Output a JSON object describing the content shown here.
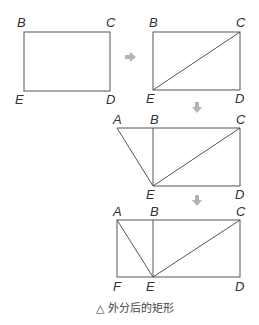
{
  "diagram": {
    "title": "外分后的矩形",
    "caption_symbol": "△",
    "caption_text": "外分后的矩形",
    "colors": {
      "line": "#555555",
      "arrow": "#b3b3b3",
      "label": "#333333"
    },
    "steps": [
      {
        "id": "step1",
        "points": {
          "B": [
            24,
            32
          ],
          "C": [
            110,
            32
          ],
          "D": [
            110,
            91
          ],
          "E": [
            24,
            91
          ]
        },
        "labels": [
          {
            "text": "B",
            "x": 17,
            "y": 27
          },
          {
            "text": "C",
            "x": 106,
            "y": 27
          },
          {
            "text": "E",
            "x": 15,
            "y": 104
          },
          {
            "text": "D",
            "x": 106,
            "y": 104
          }
        ]
      },
      {
        "id": "step2",
        "points": {
          "B": [
            153,
            32
          ],
          "C": [
            240,
            32
          ],
          "D": [
            240,
            90
          ],
          "E": [
            153,
            90
          ]
        },
        "diagonals": [
          [
            "E",
            "C"
          ]
        ],
        "labels": [
          {
            "text": "B",
            "x": 149,
            "y": 27
          },
          {
            "text": "C",
            "x": 236,
            "y": 27
          },
          {
            "text": "E",
            "x": 146,
            "y": 103
          },
          {
            "text": "D",
            "x": 235,
            "y": 103
          }
        ]
      },
      {
        "id": "step3",
        "points": {
          "A": [
            117,
            128
          ],
          "B": [
            153,
            128
          ],
          "C": [
            240,
            128
          ],
          "D": [
            240,
            186
          ],
          "E": [
            153,
            186
          ]
        },
        "diagonals": [
          [
            "E",
            "C"
          ],
          [
            "A",
            "E"
          ]
        ],
        "labels": [
          {
            "text": "A",
            "x": 113,
            "y": 124
          },
          {
            "text": "B",
            "x": 150,
            "y": 124
          },
          {
            "text": "C",
            "x": 236,
            "y": 124
          },
          {
            "text": "E",
            "x": 146,
            "y": 199
          },
          {
            "text": "D",
            "x": 235,
            "y": 199
          }
        ]
      },
      {
        "id": "step4",
        "points": {
          "A": [
            117,
            220
          ],
          "B": [
            153,
            220
          ],
          "C": [
            240,
            220
          ],
          "D": [
            240,
            277
          ],
          "E": [
            153,
            277
          ],
          "F": [
            117,
            277
          ]
        },
        "diagonals": [
          [
            "E",
            "C"
          ],
          [
            "A",
            "E"
          ]
        ],
        "labels": [
          {
            "text": "A",
            "x": 113,
            "y": 216
          },
          {
            "text": "B",
            "x": 150,
            "y": 216
          },
          {
            "text": "C",
            "x": 236,
            "y": 216
          },
          {
            "text": "F",
            "x": 113,
            "y": 291
          },
          {
            "text": "E",
            "x": 146,
            "y": 291
          },
          {
            "text": "D",
            "x": 235,
            "y": 291
          }
        ]
      }
    ],
    "arrows": [
      {
        "direction": "right",
        "x": 131,
        "y": 57
      },
      {
        "direction": "down",
        "x": 197,
        "y": 108
      },
      {
        "direction": "down",
        "x": 197,
        "y": 201
      }
    ]
  }
}
